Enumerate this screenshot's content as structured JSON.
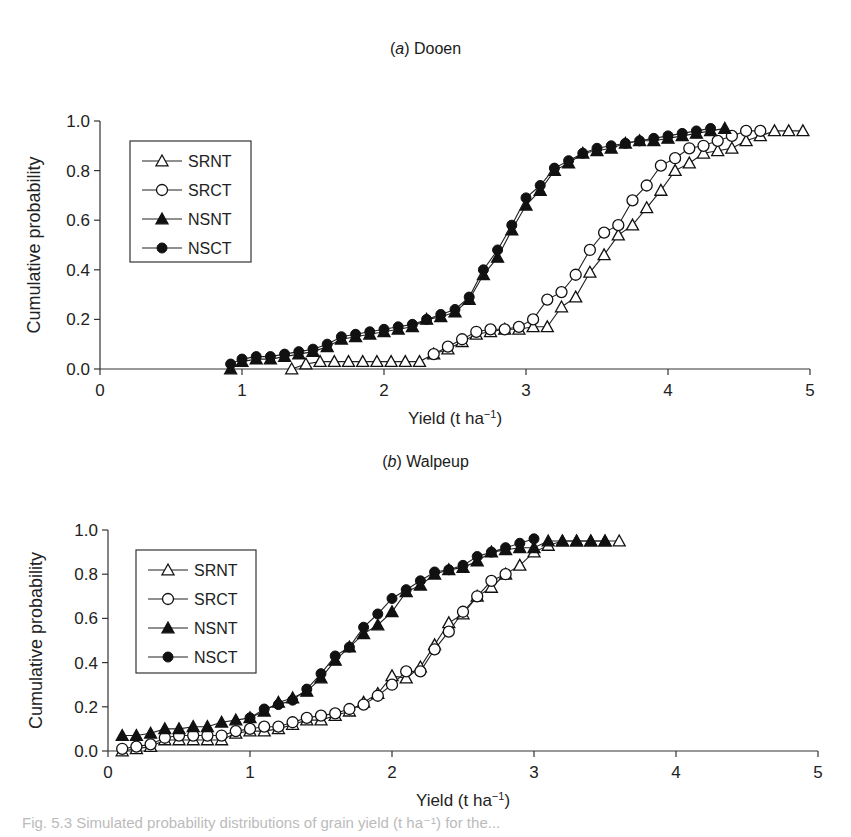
{
  "figure": {
    "panels": [
      {
        "label_letter": "a",
        "label_text": "Dooen"
      },
      {
        "label_letter": "b",
        "label_text": "Walpeup"
      }
    ],
    "caption_partial": "Fig. 5.3 Simulated probability distributions of grain yield (t ha⁻¹) for the..."
  },
  "chart_data": [
    {
      "type": "line",
      "title": "(a) Dooen",
      "xlabel": "Yield (t ha⁻¹)",
      "ylabel": "Cumulative probability",
      "xlim": [
        0,
        5
      ],
      "ylim": [
        0,
        1.0
      ],
      "xticks": [
        "0",
        "1",
        "2",
        "3",
        "4",
        "5"
      ],
      "yticks": [
        "0.0",
        "0.2",
        "0.4",
        "0.6",
        "0.8",
        "1.0"
      ],
      "grid": false,
      "legend": {
        "position": "upper-left",
        "entries": [
          "SRNT",
          "SRCT",
          "NSNT",
          "NSCT"
        ]
      },
      "series": [
        {
          "name": "SRNT",
          "marker": "open-triangle",
          "x": [
            1.35,
            1.45,
            1.55,
            1.65,
            1.75,
            1.85,
            1.95,
            2.05,
            2.15,
            2.25,
            2.35,
            2.45,
            2.55,
            2.65,
            2.75,
            2.85,
            2.95,
            3.05,
            3.15,
            3.25,
            3.35,
            3.45,
            3.55,
            3.65,
            3.75,
            3.85,
            3.95,
            4.05,
            4.15,
            4.25,
            4.35,
            4.45,
            4.55,
            4.65,
            4.75,
            4.85,
            4.95
          ],
          "y": [
            0.0,
            0.02,
            0.03,
            0.03,
            0.03,
            0.03,
            0.03,
            0.03,
            0.03,
            0.03,
            0.06,
            0.08,
            0.11,
            0.14,
            0.15,
            0.16,
            0.16,
            0.17,
            0.17,
            0.25,
            0.29,
            0.39,
            0.46,
            0.54,
            0.58,
            0.65,
            0.72,
            0.8,
            0.83,
            0.87,
            0.88,
            0.89,
            0.92,
            0.94,
            0.96,
            0.96,
            0.96
          ]
        },
        {
          "name": "SRCT",
          "marker": "open-circle",
          "x": [
            2.35,
            2.45,
            2.55,
            2.65,
            2.75,
            2.85,
            2.95,
            3.05,
            3.15,
            3.25,
            3.35,
            3.45,
            3.55,
            3.65,
            3.75,
            3.85,
            3.95,
            4.05,
            4.15,
            4.25,
            4.35,
            4.45,
            4.55,
            4.65
          ],
          "y": [
            0.06,
            0.09,
            0.12,
            0.15,
            0.16,
            0.16,
            0.17,
            0.2,
            0.28,
            0.31,
            0.38,
            0.48,
            0.55,
            0.58,
            0.68,
            0.74,
            0.82,
            0.85,
            0.89,
            0.9,
            0.92,
            0.94,
            0.96,
            0.96
          ]
        },
        {
          "name": "NSNT",
          "marker": "filled-triangle",
          "x": [
            0.92,
            1.0,
            1.1,
            1.2,
            1.3,
            1.4,
            1.5,
            1.6,
            1.7,
            1.8,
            1.9,
            2.0,
            2.1,
            2.2,
            2.3,
            2.4,
            2.5,
            2.6,
            2.7,
            2.8,
            2.9,
            3.0,
            3.1,
            3.2,
            3.3,
            3.4,
            3.5,
            3.6,
            3.7,
            3.8,
            3.9,
            4.0,
            4.1,
            4.2,
            4.3,
            4.4
          ],
          "y": [
            0.0,
            0.03,
            0.04,
            0.04,
            0.05,
            0.06,
            0.07,
            0.09,
            0.12,
            0.13,
            0.14,
            0.15,
            0.16,
            0.17,
            0.2,
            0.21,
            0.23,
            0.28,
            0.38,
            0.45,
            0.56,
            0.66,
            0.72,
            0.8,
            0.83,
            0.87,
            0.88,
            0.89,
            0.91,
            0.92,
            0.92,
            0.93,
            0.94,
            0.95,
            0.96,
            0.97
          ]
        },
        {
          "name": "NSCT",
          "marker": "filled-circle",
          "x": [
            0.92,
            1.0,
            1.1,
            1.2,
            1.3,
            1.4,
            1.5,
            1.6,
            1.7,
            1.8,
            1.9,
            2.0,
            2.1,
            2.2,
            2.3,
            2.4,
            2.5,
            2.6,
            2.7,
            2.8,
            2.9,
            3.0,
            3.1,
            3.2,
            3.3,
            3.4,
            3.5,
            3.6,
            3.7,
            3.8,
            3.9,
            4.0,
            4.1,
            4.2,
            4.3
          ],
          "y": [
            0.02,
            0.04,
            0.05,
            0.05,
            0.06,
            0.07,
            0.08,
            0.1,
            0.13,
            0.14,
            0.15,
            0.16,
            0.17,
            0.18,
            0.2,
            0.22,
            0.24,
            0.29,
            0.4,
            0.48,
            0.58,
            0.69,
            0.74,
            0.81,
            0.84,
            0.87,
            0.89,
            0.9,
            0.91,
            0.92,
            0.93,
            0.94,
            0.95,
            0.96,
            0.97
          ]
        }
      ]
    },
    {
      "type": "line",
      "title": "(b) Walpeup",
      "xlabel": "Yield (t ha⁻¹)",
      "ylabel": "Cumulative probability",
      "xlim": [
        0,
        5
      ],
      "ylim": [
        0,
        1.0
      ],
      "xticks": [
        "0",
        "1",
        "2",
        "3",
        "4",
        "5"
      ],
      "yticks": [
        "0.0",
        "0.2",
        "0.4",
        "0.6",
        "0.8",
        "1.0"
      ],
      "grid": false,
      "legend": {
        "position": "upper-left",
        "entries": [
          "SRNT",
          "SRCT",
          "NSNT",
          "NSCT"
        ]
      },
      "series": [
        {
          "name": "SRNT",
          "marker": "open-triangle",
          "x": [
            0.1,
            0.2,
            0.3,
            0.4,
            0.5,
            0.6,
            0.7,
            0.8,
            0.9,
            1.0,
            1.1,
            1.2,
            1.3,
            1.4,
            1.5,
            1.6,
            1.7,
            1.8,
            1.9,
            2.0,
            2.1,
            2.2,
            2.3,
            2.4,
            2.5,
            2.6,
            2.7,
            2.8,
            2.9,
            3.0,
            3.1,
            3.2,
            3.3,
            3.4,
            3.5,
            3.6
          ],
          "y": [
            0.0,
            0.01,
            0.02,
            0.05,
            0.05,
            0.05,
            0.05,
            0.05,
            0.08,
            0.09,
            0.09,
            0.1,
            0.12,
            0.14,
            0.14,
            0.16,
            0.18,
            0.22,
            0.26,
            0.34,
            0.33,
            0.38,
            0.48,
            0.58,
            0.62,
            0.7,
            0.74,
            0.8,
            0.84,
            0.9,
            0.93,
            0.95,
            0.95,
            0.95,
            0.95,
            0.95
          ]
        },
        {
          "name": "SRCT",
          "marker": "open-circle",
          "x": [
            0.1,
            0.2,
            0.3,
            0.4,
            0.5,
            0.6,
            0.7,
            0.8,
            0.9,
            1.0,
            1.1,
            1.2,
            1.3,
            1.4,
            1.5,
            1.6,
            1.7,
            1.8,
            1.9,
            2.0,
            2.1,
            2.2,
            2.3,
            2.4,
            2.5,
            2.6,
            2.7,
            2.8
          ],
          "y": [
            0.01,
            0.02,
            0.03,
            0.06,
            0.07,
            0.07,
            0.07,
            0.07,
            0.09,
            0.1,
            0.11,
            0.11,
            0.13,
            0.15,
            0.16,
            0.17,
            0.19,
            0.21,
            0.25,
            0.3,
            0.36,
            0.36,
            0.46,
            0.54,
            0.63,
            0.7,
            0.77,
            0.8
          ]
        },
        {
          "name": "NSNT",
          "marker": "filled-triangle",
          "x": [
            0.1,
            0.2,
            0.3,
            0.4,
            0.5,
            0.6,
            0.7,
            0.8,
            0.9,
            1.0,
            1.1,
            1.2,
            1.3,
            1.4,
            1.5,
            1.6,
            1.7,
            1.8,
            1.9,
            2.0,
            2.1,
            2.2,
            2.3,
            2.4,
            2.5,
            2.6,
            2.7,
            2.8,
            2.9,
            3.0,
            3.1,
            3.2,
            3.3,
            3.4,
            3.5
          ],
          "y": [
            0.07,
            0.07,
            0.08,
            0.1,
            0.1,
            0.11,
            0.11,
            0.13,
            0.14,
            0.15,
            0.18,
            0.22,
            0.24,
            0.27,
            0.33,
            0.41,
            0.47,
            0.53,
            0.57,
            0.63,
            0.72,
            0.75,
            0.8,
            0.82,
            0.83,
            0.86,
            0.9,
            0.91,
            0.92,
            0.92,
            0.95,
            0.95,
            0.95,
            0.95,
            0.95
          ]
        },
        {
          "name": "NSCT",
          "marker": "filled-circle",
          "x": [
            1.0,
            1.1,
            1.2,
            1.3,
            1.4,
            1.5,
            1.6,
            1.7,
            1.8,
            1.9,
            2.0,
            2.1,
            2.2,
            2.3,
            2.4,
            2.5,
            2.6,
            2.7,
            2.8,
            2.9,
            3.0
          ],
          "y": [
            0.15,
            0.19,
            0.21,
            0.23,
            0.28,
            0.35,
            0.43,
            0.47,
            0.56,
            0.62,
            0.69,
            0.73,
            0.77,
            0.81,
            0.82,
            0.84,
            0.88,
            0.9,
            0.92,
            0.94,
            0.96
          ]
        }
      ]
    }
  ]
}
